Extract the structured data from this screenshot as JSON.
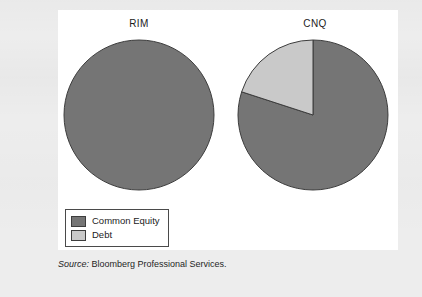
{
  "figure": {
    "source_prefix": "Source:",
    "source_text": " Bloomberg Professional Services."
  },
  "legend": {
    "items": [
      {
        "label": "Common Equity",
        "color": "#757575"
      },
      {
        "label": "Debt",
        "color": "#c9c9c9"
      }
    ]
  },
  "colors": {
    "common_equity": "#757575",
    "debt": "#c9c9c9",
    "outline": "#3d3d3d",
    "panel_background": "#ffffff",
    "page_background": "#ededed",
    "text": "#1c1c1c"
  },
  "chart_data": [
    {
      "type": "pie",
      "title": "RIM",
      "categories": [
        "Common Equity",
        "Debt"
      ],
      "values": [
        100,
        0
      ],
      "unit": "percent",
      "colors": [
        "#757575",
        "#c9c9c9"
      ],
      "start_angle": 0,
      "direction": "clockwise",
      "legend_position": "bottom-left",
      "grid": false
    },
    {
      "type": "pie",
      "title": "CNQ",
      "categories": [
        "Common Equity",
        "Debt"
      ],
      "values": [
        80,
        20
      ],
      "unit": "percent",
      "colors": [
        "#757575",
        "#c9c9c9"
      ],
      "start_angle": 0,
      "direction": "clockwise",
      "legend_position": "bottom-left",
      "grid": false
    }
  ]
}
